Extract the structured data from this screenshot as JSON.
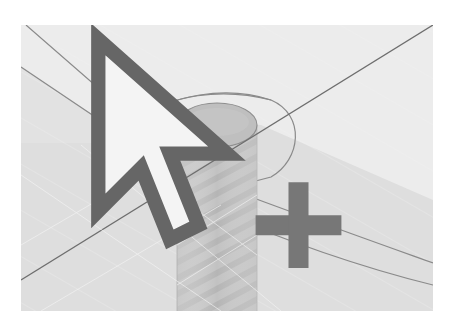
{
  "scene": {
    "type": "3d-modeling-viewport",
    "description": "Isometric view of a cylindrical column with ribbed/threaded shading, surrounded by a circular offset outline on a ground plane, with an axis line crossing the scene",
    "colors": {
      "background": "#ffffff",
      "viewport_fill": "#e9e9e9",
      "lower_plane_fill": "#dcdcdc",
      "column_fill": "#c4c4c4",
      "column_top_fill": "#bdbdbd",
      "edge_line": "#8a8a8a",
      "axis_line": "#6e6e6e",
      "cursor": "#777777"
    },
    "objects": [
      {
        "name": "column",
        "shape": "cylinder"
      },
      {
        "name": "column-top-ellipse",
        "shape": "ellipse"
      },
      {
        "name": "offset-circle-profile",
        "shape": "arc"
      },
      {
        "name": "outer-edge-upper",
        "shape": "polyline"
      },
      {
        "name": "outer-edge-lower",
        "shape": "polyline"
      },
      {
        "name": "axis-line",
        "shape": "line"
      }
    ],
    "cursor": {
      "icon": "move-cursor-icon",
      "position": {
        "x": 262,
        "y": 126
      }
    }
  }
}
